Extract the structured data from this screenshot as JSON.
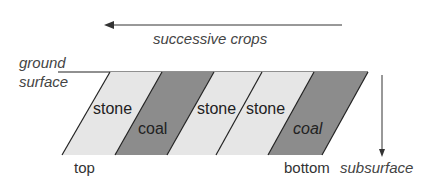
{
  "diagram": {
    "arrow_top_label": "successive crops",
    "ground_label_line1": "ground",
    "ground_label_line2": "surface",
    "depth_label": "subsurface",
    "top_label": "top",
    "bottom_label": "bottom",
    "bands": [
      {
        "label": "stone",
        "type": "stone"
      },
      {
        "label": "coal",
        "type": "coal"
      },
      {
        "label": "stone",
        "type": "stone"
      },
      {
        "label": "stone",
        "type": "stone"
      },
      {
        "label": "coal",
        "type": "coal"
      }
    ],
    "colors": {
      "stone": "#e6e6e6",
      "coal": "#8c8c8c",
      "line": "#222222"
    }
  }
}
